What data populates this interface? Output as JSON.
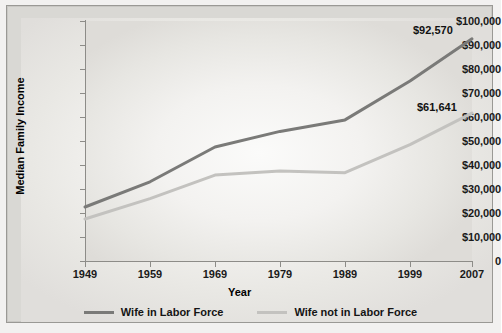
{
  "chart_data": {
    "type": "line",
    "title": "",
    "xlabel": "Year",
    "ylabel": "Median Family Income",
    "x": [
      1949,
      1959,
      1969,
      1979,
      1989,
      1999,
      2007
    ],
    "xtick_labels": [
      "1949",
      "1959",
      "1969",
      "1979",
      "1989",
      "1999",
      "2007"
    ],
    "ytick_labels": [
      "$100,000",
      "$90,000",
      "$80,000",
      "$70,000",
      "$60,000",
      "$50,000",
      "$40,000",
      "$30,000",
      "$20,000",
      "$10,000",
      "0"
    ],
    "ytick_values": [
      100000,
      90000,
      80000,
      70000,
      60000,
      50000,
      40000,
      30000,
      20000,
      10000,
      0
    ],
    "ylim": [
      0,
      100000
    ],
    "xlim": [
      1949,
      2007
    ],
    "grid": false,
    "legend_position": "bottom",
    "series": [
      {
        "name": "Wife in Labor Force",
        "color": "#7a7a78",
        "values": [
          22500,
          33000,
          47500,
          54000,
          58800,
          75000,
          92570
        ],
        "end_label": "$92,570"
      },
      {
        "name": "Wife not in Labor Force",
        "color": "#c3c2bf",
        "values": [
          17500,
          26000,
          35800,
          37500,
          36800,
          48500,
          61641
        ],
        "end_label": "$61,641"
      }
    ],
    "annotations": [
      "$92,570",
      "$61,641"
    ]
  },
  "legend": {
    "items": [
      {
        "label": "Wife in Labor Force",
        "color": "#7a7a78"
      },
      {
        "label": "Wife not in Labor Force",
        "color": "#c3c2bf"
      }
    ]
  },
  "axes": {
    "y_title": "Median Family Income",
    "x_title": "Year"
  }
}
